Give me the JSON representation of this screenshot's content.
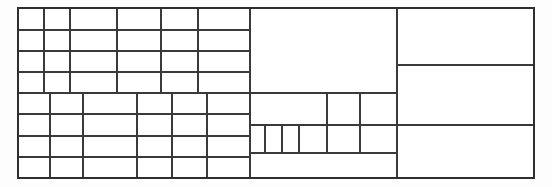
{
  "figure": {
    "kind": "table-grid-diagram",
    "background_color": "#fdfdfd",
    "cell_fill_color": "#ffffff",
    "line_color": "#3a3a3a",
    "outer_border_color": "#2e2e2e",
    "canvas": {
      "width": 552,
      "height": 187
    },
    "bounds": {
      "x0": 18,
      "y0": 8,
      "x1": 534,
      "y1": 178
    },
    "stroke_widths": {
      "outer": 2.0,
      "major": 2.0,
      "minor": 1.6
    }
  },
  "regions": [
    {
      "name": "upper-left-grid",
      "x0": 18,
      "y0": 8,
      "x1": 250,
      "y1": 93,
      "rows": 4,
      "columns": 6,
      "row_edges": [
        8,
        30,
        51,
        72,
        93
      ],
      "column_edges": [
        18,
        44,
        70,
        117,
        161,
        198,
        250
      ]
    },
    {
      "name": "lower-left-grid",
      "x0": 18,
      "y0": 93,
      "x1": 250,
      "y1": 178,
      "rows": 4,
      "columns": 6,
      "row_edges": [
        93,
        114,
        136,
        157,
        178
      ],
      "column_edges": [
        18,
        50,
        83,
        137,
        172,
        207,
        250
      ]
    },
    {
      "name": "center-large-cell",
      "x0": 250,
      "y0": 8,
      "x1": 397,
      "y1": 93,
      "rows": 1,
      "columns": 1
    },
    {
      "name": "center-mid-row",
      "x0": 250,
      "y0": 93,
      "x1": 397,
      "y1": 125,
      "rows": 1,
      "columns": 3,
      "column_edges": [
        250,
        327,
        360,
        397
      ]
    },
    {
      "name": "center-small-cells-row",
      "x0": 250,
      "y0": 125,
      "x1": 397,
      "y1": 153,
      "rows": 1,
      "columns": 6,
      "column_edges": [
        250,
        265,
        282,
        299,
        327,
        360,
        397
      ]
    },
    {
      "name": "center-bottom-wide-cell",
      "x0": 250,
      "y0": 153,
      "x1": 397,
      "y1": 178,
      "rows": 1,
      "columns": 1
    },
    {
      "name": "right-column-stack",
      "x0": 397,
      "y0": 8,
      "x1": 534,
      "y1": 178,
      "rows": 3,
      "columns": 1,
      "row_edges": [
        8,
        65,
        125,
        178
      ]
    }
  ],
  "counts": {
    "total_cells": 57,
    "upper_left_cells": 24,
    "lower_left_cells": 24,
    "center_cells": 6,
    "right_cells": 3
  },
  "labels": {
    "figure_caption": "",
    "cell_text": []
  }
}
